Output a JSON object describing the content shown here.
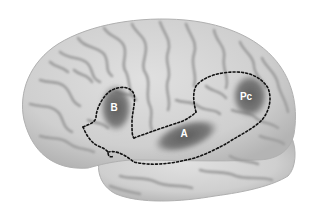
{
  "figure": {
    "colors": {
      "background": "#ffffff",
      "cortex_light": "#d6d6d6",
      "cortex_mid": "#bdbdbd",
      "sulcus": "#9a9a9a",
      "region_shade": "#5e5e5e",
      "outline": "#111111",
      "label": "#ffffff"
    },
    "regions": [
      {
        "id": "B",
        "label": "B",
        "label_x": 114,
        "label_y": 111
      },
      {
        "id": "A",
        "label": "A",
        "label_x": 184,
        "label_y": 137
      },
      {
        "id": "Pc",
        "label": "Pc",
        "label_x": 246,
        "label_y": 100
      }
    ]
  }
}
